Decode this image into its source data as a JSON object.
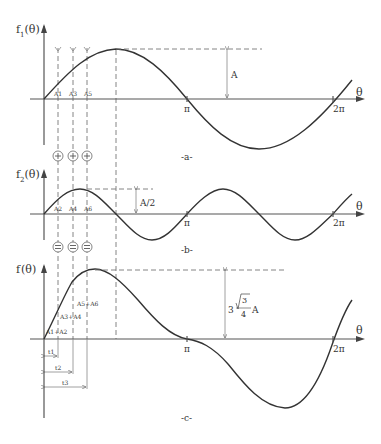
{
  "figure": {
    "panels": [
      {
        "id": "a",
        "caption": "-a-",
        "y_label_main": "f",
        "y_label_sub": "1",
        "y_label_arg": "(θ)",
        "x_label": "θ",
        "tick_pi": "π",
        "tick_2pi": "2π",
        "amplitude_label": "A",
        "point_labels": [
          "A1",
          "A3",
          "A5"
        ]
      },
      {
        "id": "b",
        "caption": "-b-",
        "y_label_main": "f",
        "y_label_sub": "2",
        "y_label_arg": "(θ)",
        "x_label": "θ",
        "tick_pi": "π",
        "tick_2pi": "2π",
        "amplitude_label": "A/2",
        "point_labels": [
          "A2",
          "A4",
          "A6"
        ]
      },
      {
        "id": "c",
        "caption": "-c-",
        "y_label_main": "f",
        "y_label_arg": "(θ)",
        "x_label": "θ",
        "tick_pi": "π",
        "tick_2pi": "2π",
        "amplitude_coef": "3",
        "amplitude_sqrt": "3",
        "amplitude_den": "4",
        "amplitude_var": "A",
        "point_labels": [
          "A1+A2",
          "A3+A4",
          "A5+A6"
        ],
        "time_labels": [
          "t1",
          "t2",
          "t3"
        ]
      }
    ],
    "operators": {
      "plus": "+",
      "equals": "="
    }
  }
}
